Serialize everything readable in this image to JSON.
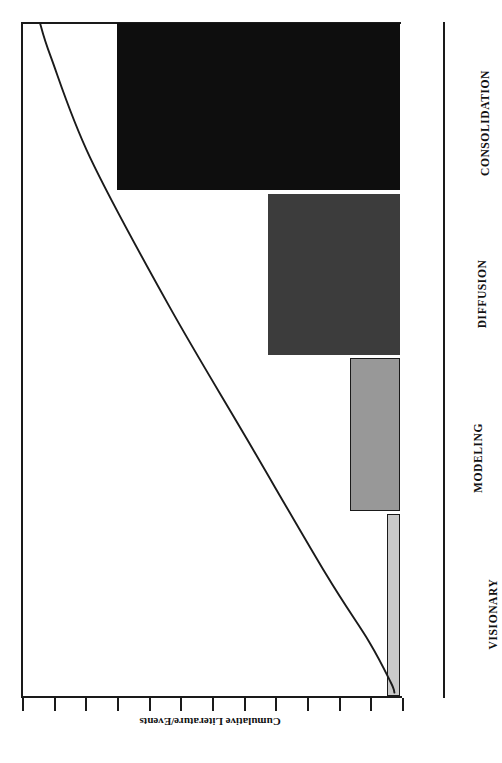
{
  "chart_data": {
    "type": "bar",
    "title": "",
    "subtitle": "",
    "xlabel": "",
    "ylabel": "Cumulative Literature/Events",
    "orientation": "horizontal",
    "grid": false,
    "legend": "none",
    "axis_title": "Cumulative Literature/Events",
    "categories": [
      "VISIONARY",
      "MODELING",
      "DIFFUSION",
      "CONSOLIDATION"
    ],
    "values": [
      3,
      14,
      34,
      72
    ],
    "value_units": "relative cumulative literature/events",
    "xlim": [
      0,
      100
    ],
    "tick_count": 13,
    "tick_values": [
      0,
      8,
      16,
      24,
      32,
      40,
      48,
      56,
      64,
      72,
      80,
      88,
      96
    ],
    "bars": [
      {
        "label": "VISIONARY",
        "value": 3,
        "color": "#c9c9c9",
        "shade": "light-gray"
      },
      {
        "label": "MODELING",
        "value": 14,
        "color": "#989898",
        "shade": "medium-gray"
      },
      {
        "label": "DIFFUSION",
        "value": 34,
        "color": "#3c3c3c",
        "shade": "dark-gray"
      },
      {
        "label": "CONSOLIDATION",
        "value": 72,
        "color": "#0e0e0e",
        "shade": "black"
      }
    ],
    "overlay_curve": {
      "name": "cumulative S-curve",
      "type": "line",
      "color": "#1a1a1a",
      "description": "S-shaped cumulative growth curve rising across the four stages",
      "points": [
        {
          "stage": "VISIONARY",
          "x": 0.5,
          "y": 1
        },
        {
          "stage": "VISIONARY",
          "x": 2,
          "y": 2
        },
        {
          "stage": "MODELING",
          "x": 8,
          "y": 8
        },
        {
          "stage": "MODELING",
          "x": 18,
          "y": 20
        },
        {
          "stage": "DIFFUSION",
          "x": 38,
          "y": 42
        },
        {
          "stage": "DIFFUSION",
          "x": 58,
          "y": 64
        },
        {
          "stage": "CONSOLIDATION",
          "x": 80,
          "y": 86
        },
        {
          "stage": "CONSOLIDATION",
          "x": 95,
          "y": 97
        },
        {
          "stage": "CONSOLIDATION",
          "x": 100,
          "y": 100
        }
      ]
    }
  },
  "figure": {
    "axis_title": "Cumulative Literature/Events",
    "categories": {
      "consolidation": "CONSOLIDATION",
      "diffusion": "DIFFUSION",
      "modeling": "MODELING",
      "visionary": "VISIONARY"
    }
  },
  "colors": {
    "consolidation": "#0e0e0e",
    "diffusion": "#3c3c3c",
    "modeling": "#989898",
    "visionary": "#c9c9c9",
    "axis": "#1a1a1a",
    "background": "#ffffff"
  }
}
